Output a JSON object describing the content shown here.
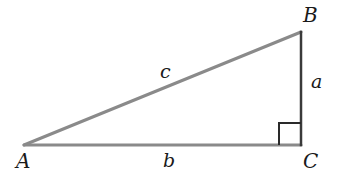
{
  "diagram": {
    "vertices": [
      {
        "id": "A",
        "label": "A",
        "x": 24,
        "y": 145,
        "label_x": 16,
        "label_y": 151
      },
      {
        "id": "B",
        "label": "B",
        "x": 301,
        "y": 32,
        "label_x": 303,
        "label_y": 5
      },
      {
        "id": "C",
        "label": "C",
        "x": 301,
        "y": 145,
        "label_x": 303,
        "label_y": 151
      }
    ],
    "sides": [
      {
        "id": "a",
        "label": "a",
        "from": "B",
        "to": "C",
        "label_x": 311,
        "label_y": 72
      },
      {
        "id": "b",
        "label": "b",
        "from": "A",
        "to": "C",
        "label_x": 163,
        "label_y": 151
      },
      {
        "id": "c",
        "label": "c",
        "from": "A",
        "to": "B",
        "label_x": 160,
        "label_y": 62
      }
    ],
    "right_angle": {
      "at": "C",
      "size": 22
    },
    "colors": {
      "hypotenuse": "#8a8a8a",
      "base": "#8a8a8a",
      "vertical": "#3a3a3a",
      "right_angle_marker": "#2a2a2a",
      "text": "#1a1a1a",
      "background": "#ffffff"
    }
  }
}
